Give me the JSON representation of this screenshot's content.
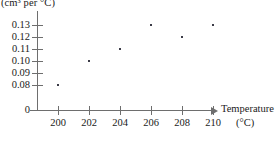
{
  "chart_data": {
    "type": "scatter",
    "title": "",
    "xlabel": "Temperature",
    "xunits": "(°C)",
    "ylabel": "(cm³ per °C)",
    "x": [
      200,
      202,
      204,
      206,
      208,
      210
    ],
    "values": [
      0.08,
      0.1,
      0.11,
      0.13,
      0.12,
      0.13
    ],
    "points": [
      {
        "x": 200,
        "y": 0.08
      },
      {
        "x": 202,
        "y": 0.1
      },
      {
        "x": 204,
        "y": 0.11
      },
      {
        "x": 206,
        "y": 0.13
      },
      {
        "x": 208,
        "y": 0.12
      },
      {
        "x": 210,
        "y": 0.13
      }
    ],
    "xtick_labels": [
      "200",
      "202",
      "204",
      "206",
      "208",
      "210"
    ],
    "ytick_labels": [
      "0.13",
      "0.12",
      "0.11",
      "0.10",
      "0.09",
      "0.08",
      "0"
    ],
    "ytick_values": [
      0.13,
      0.12,
      0.11,
      0.1,
      0.09,
      0.08,
      0
    ],
    "xlim": [
      199,
      211
    ],
    "ylim": [
      0.075,
      0.135
    ],
    "axis_broken": true,
    "grid": false,
    "legend": false,
    "marker_color": "#3b3b47",
    "axis_color": "#6e6e6e"
  },
  "axes": {
    "y_title": "(cm³ per °C)",
    "x_title": "Temperature",
    "x_units": "(°C)",
    "origin_label": "0"
  }
}
